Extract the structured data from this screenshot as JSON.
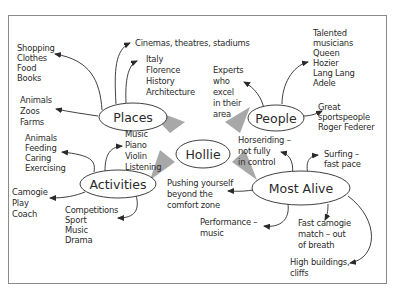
{
  "diagram": {
    "type": "mind-map",
    "center": {
      "label": "Hollie"
    },
    "branches": [
      {
        "id": "places",
        "label": "Places",
        "leaves": [
          {
            "id": "shopping",
            "lines": [
              "Shopping",
              "Clothes",
              "Food",
              "Books"
            ]
          },
          {
            "id": "cinemas",
            "lines": [
              "Cinemas, theatres, stadiums"
            ]
          },
          {
            "id": "italy",
            "lines": [
              "Italy",
              "Florence",
              "History",
              "Architecture"
            ]
          },
          {
            "id": "animals-zoos",
            "lines": [
              "Animals",
              "Zoos",
              "Farms"
            ]
          }
        ]
      },
      {
        "id": "people",
        "label": "People",
        "leaves": [
          {
            "id": "experts",
            "lines": [
              "Experts",
              "who",
              "excel",
              "in their",
              "area"
            ]
          },
          {
            "id": "musicians",
            "lines": [
              "Talented",
              "musicians",
              "Queen",
              "Hozier",
              "Lang Lang",
              "Adele"
            ]
          },
          {
            "id": "sportspeople",
            "lines": [
              "Great",
              "sportspeople",
              "Roger Federer"
            ]
          }
        ]
      },
      {
        "id": "activities",
        "label": "Activities",
        "leaves": [
          {
            "id": "animals-feeding",
            "lines": [
              "Animals",
              "Feeding",
              "Caring",
              "Exercising"
            ]
          },
          {
            "id": "music",
            "lines": [
              "Music",
              "Piano",
              "Violin",
              "Listening"
            ]
          },
          {
            "id": "camogie",
            "lines": [
              "Camogie",
              "Play",
              "Coach"
            ]
          },
          {
            "id": "competitions",
            "lines": [
              "Competitions",
              "Sport",
              "Music",
              "Drama"
            ]
          }
        ]
      },
      {
        "id": "most-alive",
        "label": "Most Alive",
        "leaves": [
          {
            "id": "horseriding",
            "lines": [
              "Horseriding –",
              "not fully",
              "in control"
            ]
          },
          {
            "id": "surfing",
            "lines": [
              "Surfing –",
              "fast pace"
            ]
          },
          {
            "id": "pushing",
            "lines": [
              "Pushing yourself",
              "beyond the",
              "comfort zone"
            ]
          },
          {
            "id": "performance",
            "lines": [
              "Performance –",
              "music"
            ]
          },
          {
            "id": "fast-camogie",
            "lines": [
              "Fast camogie",
              "match – out",
              "of breath"
            ]
          },
          {
            "id": "high-buildings",
            "lines": [
              "High buildings,",
              "cliffs"
            ]
          }
        ]
      }
    ]
  },
  "colors": {
    "ink": "#2a2a2a",
    "wedge": "#a8a8a8",
    "frame": "#8a8a8a",
    "background": "#ffffff"
  }
}
